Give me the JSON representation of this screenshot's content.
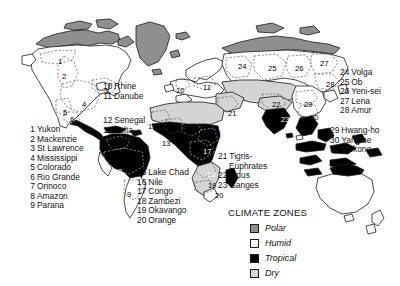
{
  "legend": {
    "title": "CLIMATE ZONES",
    "entries": [
      {
        "label": "Polar",
        "color": "#8f8f8f"
      },
      {
        "label": "Humid",
        "color": "#ffffff"
      },
      {
        "label": "Tropical",
        "color": "#000000"
      },
      {
        "label": "Dry",
        "color": "#d4d4d4"
      }
    ]
  },
  "lists": {
    "americas": [
      {
        "num": "1",
        "name": "Yukon"
      },
      {
        "num": "2",
        "name": "Mackenzie"
      },
      {
        "num": "3",
        "name": "St Lawrence"
      },
      {
        "num": "4",
        "name": "Mississippi"
      },
      {
        "num": "5",
        "name": "Colorado"
      },
      {
        "num": "6",
        "name": "Rio Grande"
      },
      {
        "num": "7",
        "name": "Orinoco"
      },
      {
        "num": "8",
        "name": "Amazon"
      },
      {
        "num": "9",
        "name": "Parana"
      }
    ],
    "europe": [
      {
        "num": "10",
        "name": "Rhine"
      },
      {
        "num": "11",
        "name": "Danube"
      }
    ],
    "africa_west": [
      {
        "num": "12",
        "name": "Senegal"
      },
      {
        "num": "13",
        "name": "Volta"
      },
      {
        "num": "14",
        "name": "Niger"
      }
    ],
    "africa_east": [
      {
        "num": "15",
        "name": "Lake Chad"
      },
      {
        "num": "16",
        "name": "Nile"
      },
      {
        "num": "17",
        "name": "Congo"
      },
      {
        "num": "18",
        "name": "Zambezi"
      },
      {
        "num": "19",
        "name": "Okavango"
      },
      {
        "num": "20",
        "name": "Orange"
      }
    ],
    "south_asia": [
      {
        "num": "21",
        "name": "Tigris-",
        "cont": "Euphrates"
      },
      {
        "num": "22",
        "name": "Indus"
      },
      {
        "num": "23",
        "name": "Ganges"
      }
    ],
    "north_asia": [
      {
        "num": "24",
        "name": "Volga"
      },
      {
        "num": "25",
        "name": "Ob"
      },
      {
        "num": "26",
        "name": "Yeni-sei"
      },
      {
        "num": "27",
        "name": "Lena"
      },
      {
        "num": "28",
        "name": "Amur"
      }
    ],
    "east_asia": [
      {
        "num": "29",
        "name": "Hwang-ho"
      },
      {
        "num": "30",
        "name": "Yangtse"
      },
      {
        "num": "31",
        "name": "Mekong"
      }
    ]
  },
  "map_numbers": [
    {
      "id": "1",
      "x": 58,
      "y": 57,
      "light": false
    },
    {
      "id": "2",
      "x": 62,
      "y": 72,
      "light": false
    },
    {
      "id": "3",
      "x": 105,
      "y": 87,
      "light": false
    },
    {
      "id": "4",
      "x": 82,
      "y": 100,
      "light": false
    },
    {
      "id": "5",
      "x": 63,
      "y": 108,
      "light": false
    },
    {
      "id": "6",
      "x": 70,
      "y": 115,
      "light": false
    },
    {
      "id": "7",
      "x": 110,
      "y": 146,
      "light": false
    },
    {
      "id": "8",
      "x": 118,
      "y": 167,
      "light": true
    },
    {
      "id": "9",
      "x": 127,
      "y": 190,
      "light": false
    },
    {
      "id": "10",
      "x": 176,
      "y": 86,
      "light": false
    },
    {
      "id": "11",
      "x": 203,
      "y": 83,
      "light": false
    },
    {
      "id": "12",
      "x": 148,
      "y": 122,
      "light": false
    },
    {
      "id": "13",
      "x": 162,
      "y": 139,
      "light": false
    },
    {
      "id": "14",
      "x": 181,
      "y": 129,
      "light": false
    },
    {
      "id": "15",
      "x": 196,
      "y": 129,
      "light": false
    },
    {
      "id": "16",
      "x": 212,
      "y": 128,
      "light": false
    },
    {
      "id": "17",
      "x": 203,
      "y": 147,
      "light": true
    },
    {
      "id": "18",
      "x": 207,
      "y": 170,
      "light": true
    },
    {
      "id": "19",
      "x": 208,
      "y": 181,
      "light": false
    },
    {
      "id": "20",
      "x": 215,
      "y": 191,
      "light": false
    },
    {
      "id": "21",
      "x": 228,
      "y": 109,
      "light": false
    },
    {
      "id": "22",
      "x": 272,
      "y": 100,
      "light": false
    },
    {
      "id": "23",
      "x": 281,
      "y": 115,
      "light": true
    },
    {
      "id": "24",
      "x": 238,
      "y": 62,
      "light": false
    },
    {
      "id": "25",
      "x": 268,
      "y": 64,
      "light": false
    },
    {
      "id": "26",
      "x": 295,
      "y": 64,
      "light": false
    },
    {
      "id": "27",
      "x": 320,
      "y": 59,
      "light": false
    },
    {
      "id": "28",
      "x": 326,
      "y": 80,
      "light": false
    },
    {
      "id": "29",
      "x": 304,
      "y": 100,
      "light": false
    },
    {
      "id": "30",
      "x": 310,
      "y": 113,
      "light": false
    },
    {
      "id": "31",
      "x": 320,
      "y": 128,
      "light": false
    }
  ]
}
